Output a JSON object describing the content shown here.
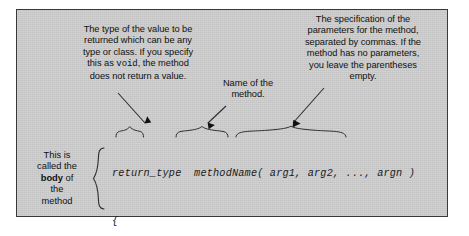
{
  "figure": {
    "kind": "annotated-syntax-diagram",
    "panel_background": "#c8c8c8",
    "panel_border_color": "#3a3a3a",
    "text_color": "#111111"
  },
  "callouts": {
    "return_type": {
      "line1": "The type of the value to be",
      "line2": "returned which can be any",
      "line3": "type or class. If you specify",
      "line4_pre": "this as ",
      "line4_mono": "void",
      "line4_post": ", the method",
      "line5": "does not return a value."
    },
    "method_name": {
      "line1": "Name of the",
      "line2": "method."
    },
    "parameters": {
      "line1": "The specification of the",
      "line2": "parameters for the method,",
      "line3": "separated by commas. If the",
      "line4": "method has no parameters,",
      "line5": "you leave the parentheses",
      "line6": "empty."
    },
    "body": {
      "line1": "This is",
      "line2": "called the",
      "line3_bold": "body",
      "line3_post": " of",
      "line4": "the",
      "line5": "method"
    }
  },
  "code": {
    "signature": "return_type  methodName( arg1, arg2, ..., argn )",
    "open_brace": "{",
    "comment": "    // Executable code goes here",
    "close_brace": "}",
    "tokens": {
      "return_type": "return_type",
      "method_name": "methodName(",
      "parameters": "arg1, arg2, ..., argn )"
    }
  }
}
